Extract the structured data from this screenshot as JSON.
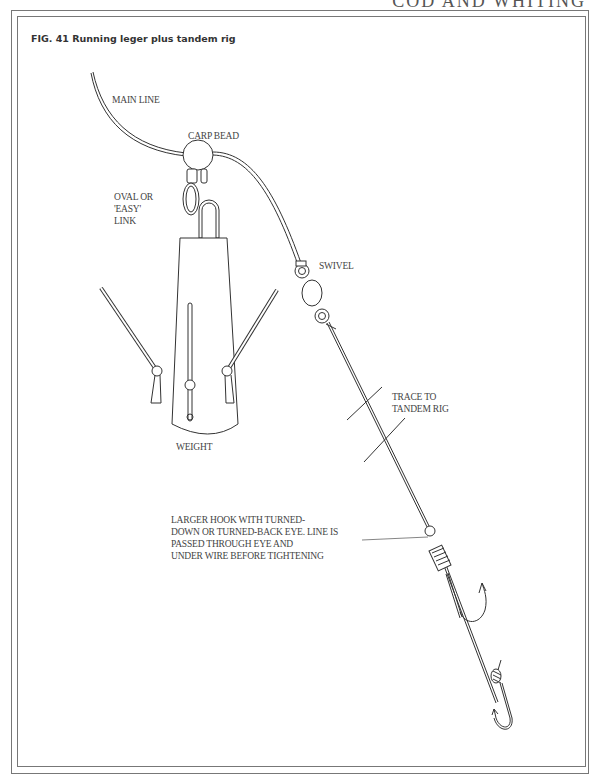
{
  "page": {
    "running_head": "COD AND WHITING"
  },
  "figure": {
    "title": "FIG. 41 Running leger plus tandem rig",
    "labels": {
      "main_line": "MAIN LINE",
      "carp_bead": "CARP BEAD",
      "oval_link": [
        "OVAL OR",
        "'EASY'",
        "LINK"
      ],
      "swivel": "SWIVEL",
      "trace": [
        "TRACE TO",
        "TANDEM RIG"
      ],
      "weight": "WEIGHT",
      "larger_hook": [
        "LARGER HOOK WITH TURNED-",
        "DOWN OR TURNED-BACK EYE. LINE IS",
        "PASSED THROUGH EYE AND",
        "UNDER WIRE BEFORE TIGHTENING"
      ]
    },
    "colors": {
      "line": "#333333",
      "frame": "#777777",
      "text": "#444444"
    }
  }
}
